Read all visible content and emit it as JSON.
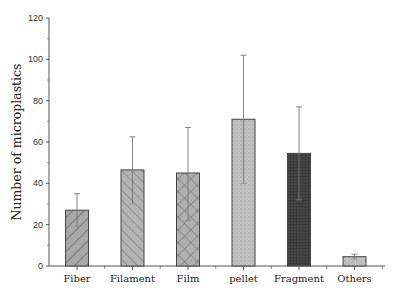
{
  "chart_data": {
    "type": "bar",
    "title": "",
    "xlabel": "",
    "ylabel": "Number of microplastics",
    "ylim": [
      0,
      120
    ],
    "yticks": [
      0,
      20,
      40,
      60,
      80,
      100,
      120
    ],
    "grid": false,
    "legend": null,
    "categories": [
      "Fiber",
      "Filament",
      "Film",
      "pellet",
      "Fragment",
      "Others"
    ],
    "values": [
      27,
      46.5,
      45,
      71,
      54.5,
      4.5
    ],
    "error_upper": [
      35,
      62.5,
      67,
      102,
      77,
      5.7
    ],
    "error_lower": [
      19,
      30,
      22,
      40,
      32,
      3.3
    ],
    "patterns": [
      "diagonal-forward",
      "diagonal-back",
      "crosshatch",
      "dots-light",
      "dots-dark",
      "dots-light"
    ],
    "fills": [
      "#a8a8a8",
      "#b4b4b4",
      "#b0b0b0",
      "#c4c4c4",
      "#3a3a3a",
      "#b8b8b8"
    ]
  }
}
